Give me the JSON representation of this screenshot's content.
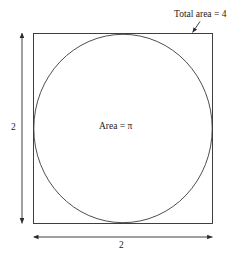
{
  "figure": {
    "title_label": "Total area = 4",
    "inner_label": "Area = π",
    "height_label": "2",
    "width_label": "2",
    "colors": {
      "stroke": "#2b2b2b",
      "circle_stroke": "#3a3a3a",
      "dimension_stroke": "#2b2b2b",
      "background": "#ffffff",
      "text": "#1a1a1a"
    },
    "geometry": {
      "square": {
        "x": 33,
        "y": 33,
        "width": 180,
        "height": 191
      },
      "circle": {
        "cx": 123,
        "cy": 128.5,
        "rx": 89.5,
        "ry": 94.5
      },
      "callout_arrow": {
        "x1": 200,
        "y1": 21,
        "x2": 192.5,
        "y2": 33
      },
      "vertical_dimension": {
        "x": 22,
        "y1": 33,
        "y2": 224
      },
      "horizontal_dimension": {
        "y": 237,
        "x1": 34,
        "x2": 213
      }
    }
  }
}
